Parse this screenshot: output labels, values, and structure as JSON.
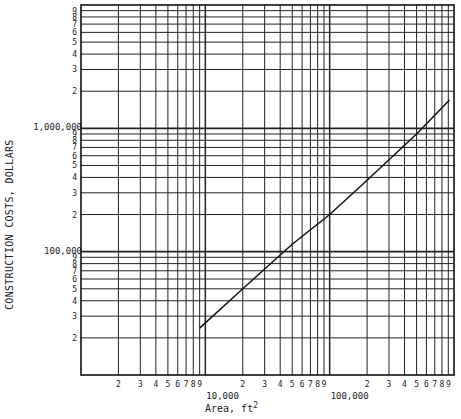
{
  "chart_data": {
    "type": "line",
    "scale": "log-log",
    "title": "",
    "xlabel": "Area, ft",
    "xlabel_superscript": "2",
    "ylabel": "CONSTRUCTION COSTS, DOLLARS",
    "xlim": [
      1000,
      1000000
    ],
    "ylim": [
      10000,
      10000000
    ],
    "grid": true,
    "x_major_tick_labels": [
      {
        "value": 10000,
        "label": "10,000"
      },
      {
        "value": 100000,
        "label": "100,000"
      }
    ],
    "x_minor_tick_labels": [
      "2",
      "3",
      "4",
      "5",
      "6",
      "7",
      "8",
      "9"
    ],
    "y_major_tick_labels": [
      {
        "value": 100000,
        "label": "100,000"
      },
      {
        "value": 1000000,
        "label": "1,000,000"
      }
    ],
    "y_minor_tick_labels": [
      "2",
      "3",
      "4",
      "5",
      "6",
      "7",
      "8",
      "9"
    ],
    "series": [
      {
        "name": "Construction cost",
        "x": [
          9000,
          20000,
          50000,
          100000,
          200000,
          500000,
          920000
        ],
        "y": [
          24000,
          50000,
          115000,
          200000,
          380000,
          900000,
          1700000
        ]
      }
    ]
  },
  "labels": {
    "ylabel": "CONSTRUCTION COSTS, DOLLARS",
    "xlabel": "Area, ft",
    "xlabel_sup": "2"
  }
}
